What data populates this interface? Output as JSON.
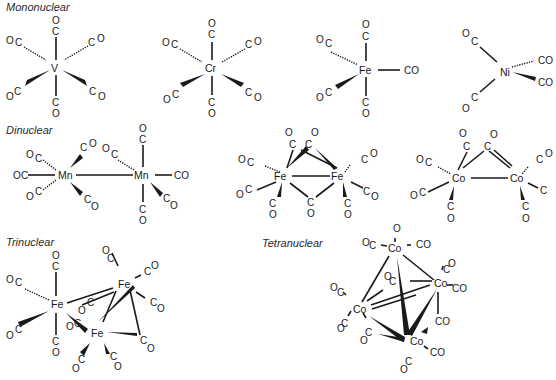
{
  "sections": {
    "mononuclear": "Mononuclear",
    "dinuclear": "Dinuclear",
    "trinuclear": "Trinuclear",
    "tetranuclear": "Tetranuclear"
  },
  "ligand": {
    "co": "CO",
    "c": "C",
    "o": "O"
  },
  "molecules": [
    {
      "id": "v-co6",
      "formula": "V(CO)6",
      "metals": [
        "V"
      ],
      "group": "mononuclear"
    },
    {
      "id": "cr-co6",
      "formula": "Cr(CO)6",
      "metals": [
        "Cr"
      ],
      "group": "mononuclear"
    },
    {
      "id": "fe-co5",
      "formula": "Fe(CO)5",
      "metals": [
        "Fe"
      ],
      "group": "mononuclear"
    },
    {
      "id": "ni-co4",
      "formula": "Ni(CO)4",
      "metals": [
        "Ni"
      ],
      "group": "mononuclear"
    },
    {
      "id": "mn2-co10",
      "formula": "Mn2(CO)10",
      "metals": [
        "Mn",
        "Mn"
      ],
      "group": "dinuclear"
    },
    {
      "id": "fe2-co9",
      "formula": "Fe2(CO)9",
      "metals": [
        "Fe",
        "Fe"
      ],
      "group": "dinuclear"
    },
    {
      "id": "co2-co8",
      "formula": "Co2(CO)8",
      "metals": [
        "Co",
        "Co"
      ],
      "group": "dinuclear"
    },
    {
      "id": "fe3-co12",
      "formula": "Fe3(CO)12",
      "metals": [
        "Fe",
        "Fe",
        "Fe"
      ],
      "group": "trinuclear"
    },
    {
      "id": "co4-co12",
      "formula": "Co4(CO)12",
      "metals": [
        "Co",
        "Co",
        "Co",
        "Co"
      ],
      "group": "tetranuclear"
    }
  ],
  "atoms": {
    "V": "V",
    "Cr": "Cr",
    "Fe": "Fe",
    "Ni": "Ni",
    "Mn": "Mn",
    "Co": "Co"
  }
}
